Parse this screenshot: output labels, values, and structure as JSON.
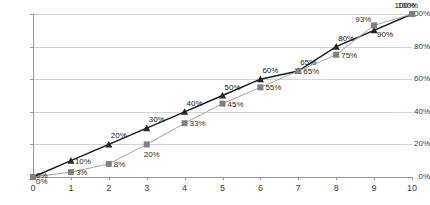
{
  "chart_data": {
    "type": "line",
    "title": "",
    "subtitle": "",
    "xlabel": "",
    "ylabel": "",
    "x": [
      0,
      1,
      2,
      3,
      4,
      5,
      6,
      7,
      8,
      9,
      10
    ],
    "xtick_labels": [
      "0",
      "1",
      "2",
      "3",
      "4",
      "5",
      "6",
      "7",
      "8",
      "9",
      "10"
    ],
    "ytick_labels": [
      "0%",
      "20%",
      "40%",
      "60%",
      "80%",
      "100%"
    ],
    "ytick_values": [
      0,
      20,
      40,
      60,
      80,
      100
    ],
    "xlim": [
      0,
      10
    ],
    "ylim": [
      0,
      100
    ],
    "grid": "horizontal",
    "legend": "none",
    "series": [
      {
        "name": "series-triangle",
        "marker": "triangle",
        "color": "#262626",
        "line_color": "#1a1a1a",
        "values": [
          0,
          10,
          20,
          30,
          40,
          50,
          60,
          65,
          80,
          90,
          100
        ],
        "labels": [
          "0%",
          "10%",
          "20%",
          "30%",
          "40%",
          "50%",
          "60%",
          "65%",
          "80%",
          "90%",
          "100%"
        ]
      },
      {
        "name": "series-square",
        "marker": "square",
        "color": "#808080",
        "line_color": "#a6a6a6",
        "values": [
          0,
          3,
          8,
          20,
          33,
          45,
          55,
          65,
          75,
          93,
          100
        ],
        "labels": [
          "0%",
          "3%",
          "8%",
          "20%",
          "33%",
          "45%",
          "55%",
          "65%",
          "75%",
          "93%",
          "100%"
        ]
      }
    ],
    "colors": {
      "grid": "#d3d3d3",
      "axis": "#9a9a9a",
      "tick_text": "#404040",
      "background": "#ffffff"
    }
  }
}
